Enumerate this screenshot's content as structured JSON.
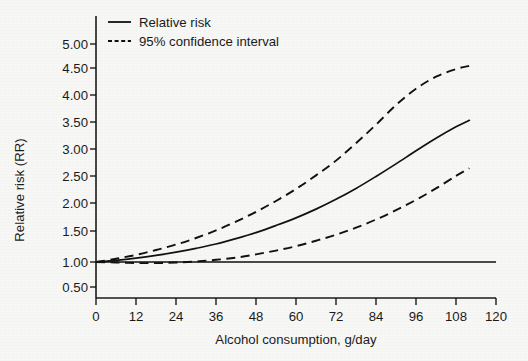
{
  "chart_data": {
    "type": "line",
    "title": "",
    "xlabel": "Alcohol consumption, g/day",
    "ylabel": "Relative risk (RR)",
    "xlim": [
      0,
      120
    ],
    "ylim": [
      0.5,
      5.0
    ],
    "xticks": [
      0,
      12,
      24,
      36,
      48,
      60,
      72,
      84,
      96,
      108,
      120
    ],
    "xtick_labels": [
      "0",
      "12",
      "24",
      "36",
      "48",
      "60",
      "72",
      "84",
      "96",
      "108",
      "120"
    ],
    "yticks": [
      0.5,
      1.0,
      1.5,
      2.0,
      2.5,
      3.0,
      3.5,
      4.0,
      4.5,
      5.0
    ],
    "ytick_labels": [
      "0.50",
      "1.00",
      "1.50",
      "2.00",
      "2.50",
      "3.00",
      "3.50",
      "4.00",
      "4.50",
      "5.00"
    ],
    "grid": false,
    "legend_position": "top-left",
    "reference_line": {
      "name": "Null reference (RR = 1.00)",
      "y": 1.0,
      "style": "solid",
      "x_start": 0,
      "x_end": 120
    },
    "x": [
      0,
      6,
      12,
      18,
      24,
      30,
      36,
      42,
      48,
      54,
      60,
      66,
      72,
      78,
      84,
      90,
      96,
      102,
      108,
      112
    ],
    "series": [
      {
        "name": "Relative risk",
        "style": "solid",
        "values": [
          1.0,
          1.03,
          1.07,
          1.12,
          1.18,
          1.25,
          1.33,
          1.43,
          1.54,
          1.67,
          1.81,
          1.97,
          2.15,
          2.35,
          2.57,
          2.8,
          3.04,
          3.27,
          3.48,
          3.6
        ]
      },
      {
        "name": "95% confidence interval upper",
        "style": "dashed",
        "values": [
          1.0,
          1.06,
          1.13,
          1.22,
          1.32,
          1.44,
          1.58,
          1.74,
          1.92,
          2.12,
          2.34,
          2.59,
          2.86,
          3.18,
          3.52,
          3.88,
          4.18,
          4.4,
          4.54,
          4.6
        ]
      },
      {
        "name": "95% confidence interval lower",
        "style": "dashed",
        "values": [
          1.0,
          0.99,
          0.98,
          0.98,
          0.99,
          1.01,
          1.04,
          1.08,
          1.14,
          1.21,
          1.29,
          1.39,
          1.5,
          1.63,
          1.78,
          1.95,
          2.14,
          2.35,
          2.58,
          2.72
        ]
      }
    ],
    "legend": [
      {
        "label": "Relative risk",
        "style": "solid"
      },
      {
        "label": "95% confidence interval",
        "style": "dashed"
      }
    ]
  },
  "colors": {
    "background": "#f7f7f5",
    "ink": "#111111",
    "axis": "#1b1b1b"
  }
}
